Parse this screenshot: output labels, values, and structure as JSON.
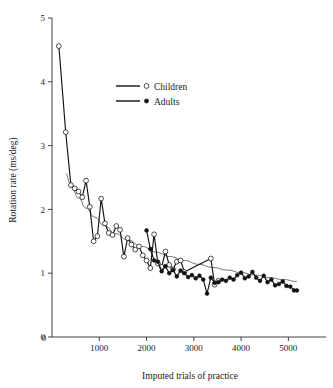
{
  "chart_data": {
    "type": "line",
    "title": "",
    "xlabel": "Imputed trials of practice",
    "ylabel": "Rotation rate (ms/deg)",
    "xlim": [
      0,
      5500
    ],
    "ylim": [
      0,
      5
    ],
    "xticks": [
      0,
      1000,
      2000,
      3000,
      4000,
      5000
    ],
    "xticklabels": [
      "0",
      "1000",
      "2000",
      "3000",
      "4000",
      "5000"
    ],
    "yticks": [
      0,
      1,
      2,
      3,
      4,
      5
    ],
    "yticklabels": [
      "0",
      "1",
      "2",
      "3",
      "4",
      "5"
    ],
    "grid": false,
    "legend_position": "upper center",
    "series": [
      {
        "name": "Children",
        "marker": "open-circle",
        "x": [
          145,
          290,
          400,
          480,
          560,
          640,
          720,
          800,
          880,
          960,
          1040,
          1120,
          1200,
          1280,
          1360,
          1440,
          1520,
          1600,
          1680,
          1760,
          1840,
          1920,
          2000,
          2080,
          2160,
          2240,
          2320,
          2400,
          2480,
          2560,
          2640,
          2720,
          2800,
          3360,
          3440,
          3520
        ],
        "y": [
          4.56,
          3.21,
          2.38,
          2.33,
          2.28,
          2.19,
          2.45,
          2.04,
          1.5,
          1.58,
          2.17,
          1.78,
          1.63,
          1.6,
          1.74,
          1.68,
          1.26,
          1.55,
          1.45,
          1.37,
          1.42,
          1.28,
          1.2,
          1.08,
          1.61,
          1.15,
          1.1,
          1.34,
          1.13,
          1.06,
          1.18,
          1.2,
          1.02,
          1.23,
          0.82,
          0.88
        ]
      },
      {
        "name": "Adults",
        "marker": "filled-circle",
        "x": [
          2000,
          2080,
          2160,
          2240,
          2320,
          2400,
          2480,
          2560,
          2640,
          2720,
          2800,
          2880,
          2960,
          3040,
          3120,
          3200,
          3280,
          3360,
          3440,
          3520,
          3600,
          3680,
          3760,
          3840,
          3920,
          4000,
          4080,
          4160,
          4240,
          4320,
          4400,
          4480,
          4560,
          4640,
          4720,
          4800,
          4880,
          4960,
          5040,
          5120,
          5180
        ],
        "y": [
          1.67,
          1.38,
          1.2,
          1.18,
          1.03,
          1.11,
          1.0,
          1.05,
          0.95,
          1.04,
          1.0,
          0.94,
          0.97,
          0.92,
          0.96,
          0.9,
          0.68,
          0.93,
          0.85,
          0.86,
          0.9,
          0.88,
          0.93,
          0.9,
          0.97,
          1.01,
          0.92,
          0.95,
          1.02,
          0.93,
          0.88,
          0.96,
          0.86,
          0.9,
          0.81,
          0.83,
          0.87,
          0.8,
          0.79,
          0.73,
          0.73
        ]
      }
    ],
    "trend": {
      "name": "fitted-power-curve",
      "x": [
        290,
        400,
        560,
        720,
        900,
        1100,
        1350,
        1600,
        1900,
        2200,
        2500,
        2800,
        3100,
        3400,
        3700,
        4000,
        4300,
        4600,
        4900,
        5180
      ],
      "y": [
        2.56,
        2.38,
        2.18,
        2.02,
        1.88,
        1.75,
        1.62,
        1.52,
        1.42,
        1.33,
        1.26,
        1.2,
        1.14,
        1.09,
        1.05,
        1.01,
        0.97,
        0.93,
        0.9,
        0.87
      ]
    }
  },
  "legend": {
    "entries": [
      {
        "label": "Children",
        "marker": "open-circle"
      },
      {
        "label": "Adults",
        "marker": "filled-circle"
      }
    ]
  },
  "colors": {
    "ink": "#111111",
    "axis": "#2b2b2b",
    "trend": "#3a3a3a",
    "background": "#ffffff"
  }
}
